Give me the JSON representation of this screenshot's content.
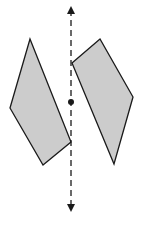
{
  "diagram": {
    "colors": {
      "fill": "#cccccc",
      "stroke": "#1a1a1a",
      "line": "#1a1a1a",
      "background": "#ffffff"
    },
    "axis": {
      "x": 71,
      "y1": 4,
      "y2": 214,
      "dot": {
        "x": 71,
        "y": 102
      }
    },
    "shapes": [
      {
        "name": "left-quadrilateral",
        "points": "30,39 10,108 43,165 71,142"
      },
      {
        "name": "right-quadrilateral",
        "points": "72,63 100,39 133,97 114,164"
      }
    ]
  }
}
